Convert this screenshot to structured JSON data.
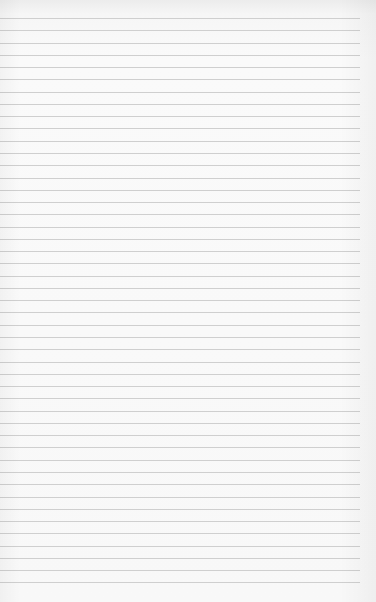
{
  "image": {
    "description": "Blank ruled notebook paper",
    "background_color": "#f8f8f8",
    "rule_color": "#cfcfcf",
    "rule_count": 47,
    "first_rule_y": 18,
    "rule_spacing": 12.27,
    "rule_start_x": 0,
    "rule_end_x": 360
  }
}
